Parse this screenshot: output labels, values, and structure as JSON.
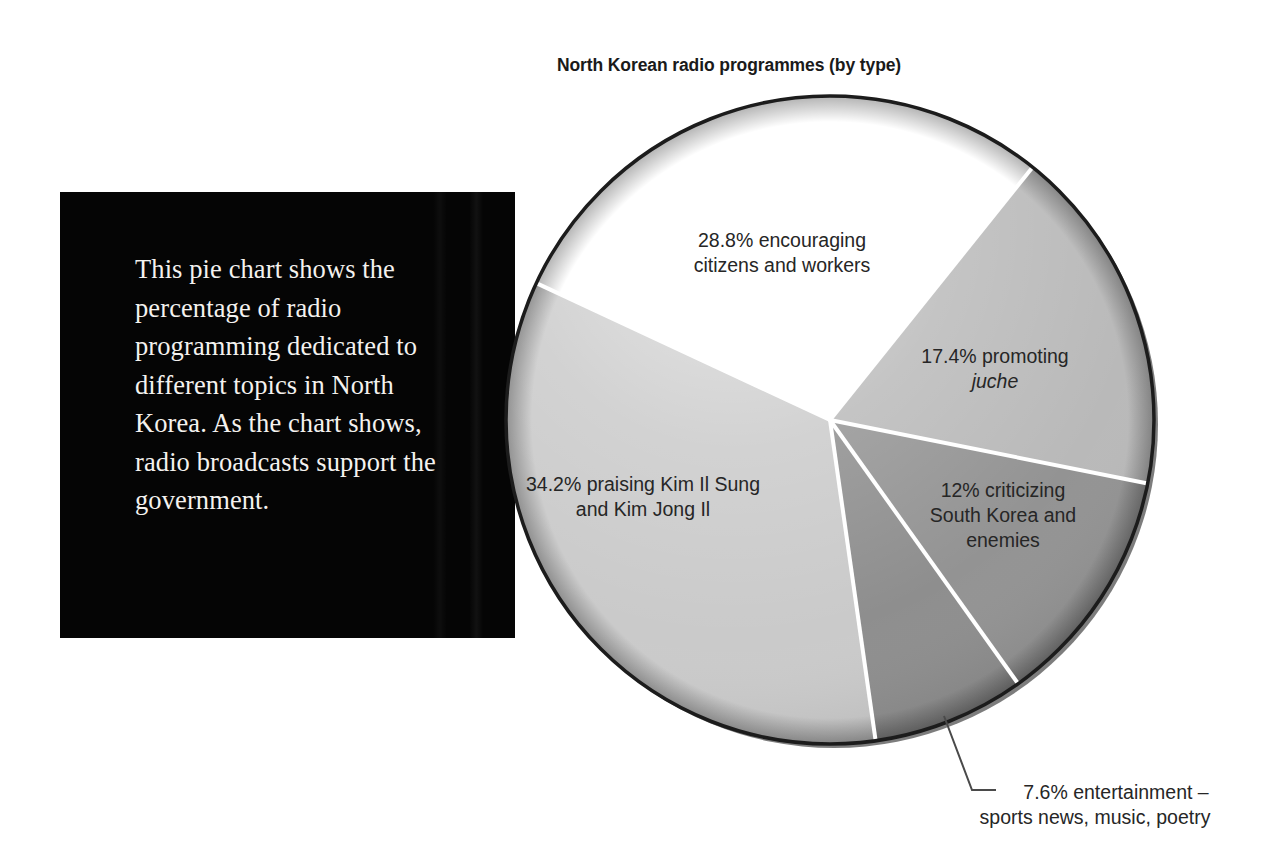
{
  "chart_data": {
    "type": "pie",
    "title": "North Korean radio programmes (by type)",
    "xlabel": "",
    "ylabel": "",
    "legend_position": "none",
    "grid": false,
    "unit": "percent",
    "total": 100,
    "categories": [
      "encouraging citizens and workers",
      "promoting juche",
      "criticizing South Korea and enemies",
      "entertainment – sports news, music, poetry",
      "praising Kim Il Sung and Kim Jong Il"
    ],
    "values": [
      28.8,
      17.4,
      12,
      7.6,
      34.2
    ],
    "slices": [
      {
        "id": "encouraging",
        "percent": 28.8,
        "percent_text": "28.8%",
        "label_line1": "28.8% encouraging",
        "label_line2": "citizens and workers",
        "color": "#ffffff",
        "start_deg": 295.0,
        "sweep_deg": 103.7
      },
      {
        "id": "juche",
        "percent": 17.4,
        "percent_text": "17.4%",
        "label_line1": "17.4% promoting",
        "label_line2": "juche",
        "label_line2_italic": true,
        "color": "#b9b9b9",
        "start_deg": 38.7,
        "sweep_deg": 62.6
      },
      {
        "id": "criticizing",
        "percent": 12,
        "percent_text": "12%",
        "label_line1": "12% criticizing",
        "label_line2": "South Korea and",
        "label_line3": "enemies",
        "color": "#939393",
        "start_deg": 101.3,
        "sweep_deg": 43.2
      },
      {
        "id": "entertainment",
        "percent": 7.6,
        "percent_text": "7.6%",
        "label_line1": "7.6% entertainment –",
        "label_line2": "sports news, music, poetry",
        "color": "#8e8e8e",
        "start_deg": 144.5,
        "sweep_deg": 27.4
      },
      {
        "id": "praising",
        "percent": 34.2,
        "percent_text": "34.2%",
        "label_line1": "34.2% praising Kim Il Sung",
        "label_line2": "and Kim Jong Il",
        "color": "#cacaca",
        "start_deg": 171.9,
        "sweep_deg": 123.1
      }
    ]
  },
  "caption": {
    "text": "This pie chart shows the percentage of radio programming dedicated to different topics in North Korea. As the chart shows, radio broadcasts support the government.",
    "background_color": "#050505",
    "text_color": "#f4f2ef"
  },
  "colors": {
    "page_background": "#ffffff",
    "title_text": "#1a1a1a",
    "label_text": "#262626",
    "pie_outline": "#1c1c1c",
    "slice_divider": "#ffffff",
    "leader_line": "#4a4a4a"
  },
  "leader": {
    "target_label": "7.6% entertainment – sports news, music, poetry"
  }
}
